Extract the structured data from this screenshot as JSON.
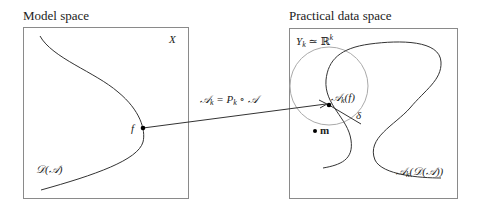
{
  "left_panel": {
    "title": "Model space",
    "space_label": "X",
    "curve_label": "𝒟(𝒜)",
    "point_label": "f"
  },
  "right_panel": {
    "title": "Practical data space",
    "space_label_main": "Y",
    "space_label_sub": "k",
    "space_label_rel": " ≃ ℝ",
    "space_label_sup": "k",
    "image_point_label_main": "𝒜",
    "image_point_label_sub": "k",
    "image_point_label_arg": "(f)",
    "radius_label": "δ",
    "center_label": "m",
    "curve_label_main": "𝒜",
    "curve_label_sub": "k",
    "curve_label_arg": "(𝒟(𝒜))"
  },
  "mapping": {
    "label_lhs_main": "𝒜",
    "label_lhs_sub": "k",
    "label_eq": " = P",
    "label_rhs_sub": "k",
    "label_rhs_tail": " ∘ 𝒜"
  },
  "colors": {
    "frame": "#8a8a8a",
    "curve": "#333333",
    "circle": "#a8a8a8",
    "point": "#000000"
  }
}
